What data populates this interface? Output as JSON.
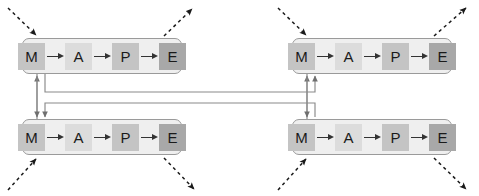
{
  "diagram": {
    "stage": {
      "width": 479,
      "height": 196,
      "background": "#ffffff"
    },
    "cell_colors": {
      "monitor": "#c4c4c4",
      "analyze": "#dcdcdc",
      "plan": "#c4c4c4",
      "execute": "#a8a8a8",
      "container": "#efefef",
      "container_border": "#9a9a9a",
      "solid_wire": "#7a7a7a",
      "dashed_wire": "#1a1a1a",
      "inner_arrow": "#333333"
    },
    "stages": [
      {
        "key": "monitor",
        "label": "M"
      },
      {
        "key": "analyze",
        "label": "A"
      },
      {
        "key": "plan",
        "label": "P"
      },
      {
        "key": "execute",
        "label": "E"
      }
    ],
    "pipelines": [
      {
        "id": "top-left",
        "position": "top-left",
        "x": 22,
        "y": 38,
        "width": 160,
        "height": 36
      },
      {
        "id": "top-right",
        "position": "top-right",
        "x": 292,
        "y": 38,
        "width": 160,
        "height": 36
      },
      {
        "id": "bottom-left",
        "position": "bottom-left",
        "x": 22,
        "y": 119,
        "width": 160,
        "height": 36
      },
      {
        "id": "bottom-right",
        "position": "bottom-right",
        "x": 292,
        "y": 119,
        "width": 160,
        "height": 36
      }
    ],
    "external_arrows": [
      {
        "id": "in-top-left",
        "kind": "dashed",
        "direction": "inbound",
        "target": "monitor",
        "pipeline": "top-left"
      },
      {
        "id": "out-top-left",
        "kind": "dashed",
        "direction": "outbound",
        "target": "execute",
        "pipeline": "top-left"
      },
      {
        "id": "in-top-right",
        "kind": "dashed",
        "direction": "inbound",
        "target": "monitor",
        "pipeline": "top-right"
      },
      {
        "id": "out-top-right",
        "kind": "dashed",
        "direction": "outbound",
        "target": "execute",
        "pipeline": "top-right"
      },
      {
        "id": "in-bottom-left",
        "kind": "dashed",
        "direction": "inbound",
        "target": "monitor",
        "pipeline": "bottom-left"
      },
      {
        "id": "out-bottom-left",
        "kind": "dashed",
        "direction": "outbound",
        "target": "execute",
        "pipeline": "bottom-left"
      },
      {
        "id": "in-bottom-right",
        "kind": "dashed",
        "direction": "inbound",
        "target": "monitor",
        "pipeline": "bottom-right"
      },
      {
        "id": "out-bottom-right",
        "kind": "dashed",
        "direction": "outbound",
        "target": "execute",
        "pipeline": "bottom-right"
      }
    ],
    "cross_links": [
      {
        "id": "left-vertical",
        "kind": "solid",
        "from": "top-left.monitor",
        "to": "bottom-left.monitor"
      },
      {
        "id": "right-vertical",
        "kind": "solid",
        "from": "top-right.monitor",
        "to": "bottom-right.monitor"
      },
      {
        "id": "upper-bus",
        "kind": "solid",
        "from": "top-left.monitor",
        "to": "bottom-right.monitor"
      },
      {
        "id": "lower-bus",
        "kind": "solid",
        "from": "bottom-left.monitor",
        "to": "top-right.monitor"
      }
    ]
  }
}
